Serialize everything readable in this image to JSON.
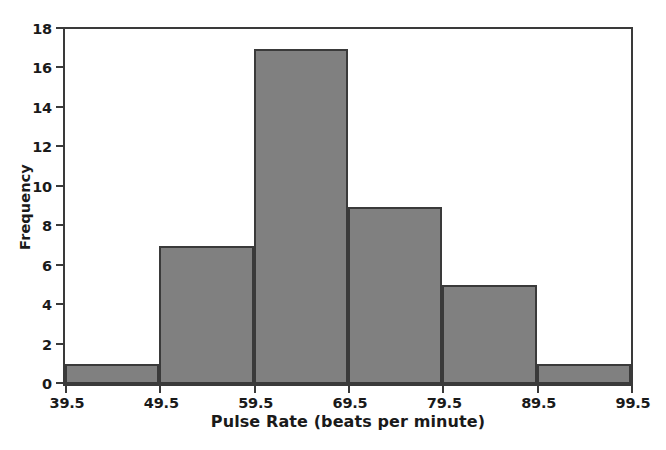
{
  "chart_data": {
    "type": "bar",
    "title": "",
    "subtitle": "",
    "xlabel": "Pulse Rate (beats per minute)",
    "ylabel": "Frequency",
    "categories": [
      "39.5-49.5",
      "49.5-59.5",
      "59.5-69.5",
      "69.5-79.5",
      "79.5-89.5",
      "89.5-99.5"
    ],
    "values": [
      1,
      7,
      17,
      9,
      5,
      1
    ],
    "bin_edges": [
      39.5,
      49.5,
      59.5,
      69.5,
      79.5,
      89.5,
      99.5
    ],
    "bin_width": 10,
    "xlim": [
      39.5,
      99.5
    ],
    "ylim": [
      0,
      18
    ],
    "ytick_values": [
      0,
      2,
      4,
      6,
      8,
      10,
      12,
      14,
      16,
      18
    ],
    "ytick_labels": [
      "0",
      "2",
      "4",
      "6",
      "8",
      "10",
      "12",
      "14",
      "16",
      "18"
    ],
    "xtick_values": [
      39.5,
      49.5,
      59.5,
      69.5,
      79.5,
      89.5,
      99.5
    ],
    "xtick_labels": [
      "39.5",
      "49.5",
      "59.5",
      "69.5",
      "79.5",
      "89.5",
      "99.5"
    ],
    "grid": false,
    "legend": null,
    "legend_position": "none",
    "annotations": [],
    "total_count": 40,
    "colors": {
      "bar_fill": "#808080",
      "bar_edge": "#3a3a3a",
      "axis": "#3a3a3a",
      "text": "#1a1a1a",
      "background": "#ffffff",
      "plot_background": "#ffffff"
    }
  }
}
